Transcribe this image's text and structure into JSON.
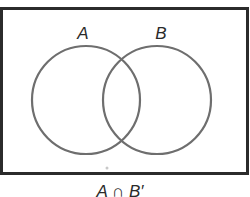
{
  "diagram": {
    "type": "venn",
    "universe": {
      "x": 1,
      "y": 8,
      "width": 247,
      "height": 166,
      "stroke": "#2b2b2b",
      "stroke_width": 3
    },
    "sets": [
      {
        "label": "A",
        "cx": 86,
        "cy": 100,
        "r": 54,
        "label_x": 83,
        "label_y": 39,
        "stroke": "#6e6e6e"
      },
      {
        "label": "B",
        "cx": 157,
        "cy": 100,
        "r": 54,
        "label_x": 161,
        "label_y": 39,
        "stroke": "#6e6e6e"
      }
    ],
    "shaded_region": "none",
    "caption": "A ∩ B′"
  }
}
